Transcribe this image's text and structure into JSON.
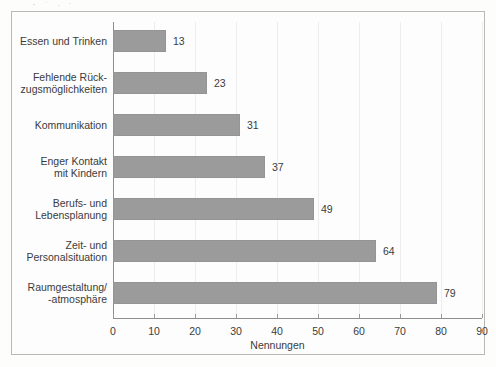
{
  "chart_data": {
    "type": "bar",
    "orientation": "horizontal",
    "title": "",
    "subtitle": "",
    "xlabel": "Nennungen",
    "ylabel": "",
    "xlim": [
      0,
      90
    ],
    "xticks": [
      "0",
      "10",
      "20",
      "30",
      "40",
      "50",
      "60",
      "70",
      "80",
      "90"
    ],
    "grid": "vertical",
    "legend": "none",
    "categories": [
      "Essen und Trinken",
      "Fehlende Rück-\nzugsmöglichkeiten",
      "Kommunikation",
      "Enger Kontakt\nmit Kindern",
      "Berufs- und\nLebensplanung",
      "Zeit- und\nPersonalsituation",
      "Raumgestaltung/\n-atmosphäre"
    ],
    "values": [
      13,
      23,
      31,
      37,
      49,
      64,
      79
    ],
    "value_labels": [
      "13",
      "23",
      "31",
      "37",
      "49",
      "64",
      "79"
    ],
    "bar_color": "#9b9b9b",
    "grid_color": "#ededed",
    "axis_color": "#8e8e8e",
    "text_color": "#3b3b3b",
    "background": "#fdfdfd"
  }
}
